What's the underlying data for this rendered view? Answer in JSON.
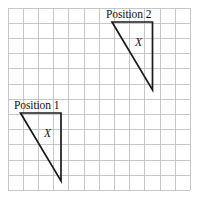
{
  "figure": {
    "background_color": "#ffffff",
    "width": 198,
    "height": 205
  },
  "grid": {
    "line_color": "#b9b9bd",
    "origin_x": 8,
    "origin_y": 8,
    "cell_size": 15.2,
    "columns": 12,
    "rows": 12
  },
  "shapes": {
    "stroke_color": "#1b1b1b",
    "position_1": {
      "label": "Position 1",
      "label_x": 14,
      "label_y": 100,
      "inner_label": "X",
      "inner_label_x": 44,
      "inner_label_y": 128,
      "points": "20.5,113 61,113 61,181",
      "vertices": [
        {
          "x": 20.5,
          "y": 113
        },
        {
          "x": 61,
          "y": 113
        },
        {
          "x": 61,
          "y": 181
        }
      ]
    },
    "position_2": {
      "label": "Position 2",
      "label_x": 106,
      "label_y": 9,
      "inner_label": "X",
      "inner_label_x": 135,
      "inner_label_y": 37,
      "points": "112,22 152.5,22 152.5,90",
      "vertices": [
        {
          "x": 112,
          "y": 22
        },
        {
          "x": 152.5,
          "y": 22
        },
        {
          "x": 152.5,
          "y": 90
        }
      ]
    }
  }
}
